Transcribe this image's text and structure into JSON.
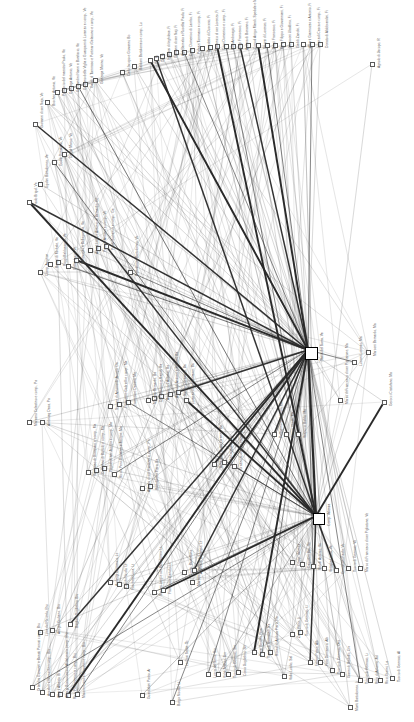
{
  "meta": {
    "background_color": "#ffffff",
    "node_fill": "#ffffff",
    "node_stroke": "#5a5a5a",
    "edge_color": "#2a2a2a",
    "label_color": "#3c3c3c",
    "label_rotation_deg": -90,
    "canvas": {
      "width": 414,
      "height": 722
    }
  },
  "hubs": [
    {
      "id": "hub_venezia",
      "label": "Tassa del Sorra, Ve",
      "x": 305,
      "y": 347,
      "size": 13
    },
    {
      "id": "hub_firenze",
      "label": "Comp. Valenza",
      "x": 313,
      "y": 513,
      "size": 12
    }
  ],
  "nodes": [
    {
      "label": "Giovanni di ser Naja, Ve",
      "x": 33,
      "y": 122,
      "size": 5
    },
    {
      "label": "Brocheri Antonio, Ve",
      "x": 45,
      "y": 100,
      "size": 5
    },
    {
      "label": "Peduccio del maestro Paolo, Ve",
      "x": 55,
      "y": 90,
      "size": 5
    },
    {
      "label": "Gonzaga Antonio, Ve",
      "x": 62,
      "y": 88,
      "size": 5
    },
    {
      "label": "Goccandini Nanni e Bonifacio, Ve",
      "x": 69,
      "y": 86,
      "size": 5
    },
    {
      "label": "Gaetano delle Viglia e Guasparri di Lorenzo e comp., Ve",
      "x": 76,
      "y": 84,
      "size": 5
    },
    {
      "label": "Gaudi di Tommaso e Portinari Gelasono e comp., Ve",
      "x": 83,
      "y": 82,
      "size": 5
    },
    {
      "label": "Gonzaga Marino, Ve",
      "x": 93,
      "y": 78,
      "size": 5
    },
    {
      "label": "Carlo Iacopo e Giovanni, Bo",
      "x": 120,
      "y": 70,
      "size": 5
    },
    {
      "label": "Baldiani Bartolomeo e comp., Lu",
      "x": 132,
      "y": 64,
      "size": 5
    },
    {
      "label": "Dir, Fi",
      "x": 148,
      "y": 58,
      "size": 5
    },
    {
      "label": "Dir, Fi",
      "x": 154,
      "y": 56,
      "size": 5
    },
    {
      "label": "Inghilesi di Inghilese, Fi",
      "x": 160,
      "y": 54,
      "size": 5
    },
    {
      "label": "Giovanni di ser Naji, Fi",
      "x": 167,
      "y": 52,
      "size": 5
    },
    {
      "label": "Agli Barnabo e Rucellai Paolo, Fi",
      "x": 174,
      "y": 50,
      "size": 5
    },
    {
      "label": "Di ser Domenico di Lambo, Fi",
      "x": 182,
      "y": 50,
      "size": 5
    },
    {
      "label": "Palazzi Tommaso e comp., Fi",
      "x": 190,
      "y": 48,
      "size": 5
    },
    {
      "label": "Benedetto di Duccerio, Fi",
      "x": 200,
      "y": 46,
      "size": 5
    },
    {
      "label": "Domenico di ser Lorenzo, Fi",
      "x": 208,
      "y": 45,
      "size": 5
    },
    {
      "label": "Corsi Domenico e comp., Fi",
      "x": 215,
      "y": 44,
      "size": 5
    },
    {
      "label": "Boni Andreagio, Fi",
      "x": 224,
      "y": 44,
      "size": 5
    },
    {
      "label": "Longi Francesco, Fi",
      "x": 231,
      "y": 44,
      "size": 5
    },
    {
      "label": "Andrea di Bonanno, Fi",
      "x": 238,
      "y": 44,
      "size": 5
    },
    {
      "label": "Corsoli Arrigo Mandi, Spedale e Miliorotti, Fi",
      "x": 246,
      "y": 43,
      "size": 5
    },
    {
      "label": "Strozzi di Lorenzo, Fi",
      "x": 256,
      "y": 43,
      "size": 5
    },
    {
      "label": "Bosci Francesco, Fi",
      "x": 265,
      "y": 43,
      "size": 5
    },
    {
      "label": "Ricci Filippo e Giovanniani, Fi",
      "x": 273,
      "y": 43,
      "size": 5
    },
    {
      "label": "Guasconi Ubaldino, Fi",
      "x": 281,
      "y": 42,
      "size": 5
    },
    {
      "label": "Gaddi Zanobi, Fi",
      "x": 289,
      "y": 42,
      "size": 5
    },
    {
      "label": "Alberti Giannozzo e Antonio, Fi",
      "x": 301,
      "y": 42,
      "size": 5
    },
    {
      "label": "Lorenzoli Cesca e comp., Fi",
      "x": 310,
      "y": 42,
      "size": 5
    },
    {
      "label": "Donato di Aldobrandini, Fi",
      "x": 318,
      "y": 42,
      "size": 5
    },
    {
      "label": "Agnolo di Jacopo, R",
      "x": 370,
      "y": 62,
      "size": 5
    },
    {
      "label": "Paolo Brigol, Ve",
      "x": 27,
      "y": 200,
      "size": 5
    },
    {
      "label": "Ugolini Bartolomeo, Ve",
      "x": 38,
      "y": 182,
      "size": 5
    },
    {
      "label": "Goddi Donatello, Ve",
      "x": 52,
      "y": 160,
      "size": 5
    },
    {
      "label": "Diegol Marco, Ve",
      "x": 62,
      "y": 152,
      "size": 5
    },
    {
      "label": "Comp. Avignon",
      "x": 38,
      "y": 270,
      "size": 5
    },
    {
      "label": "Bonso di Michele, Ve",
      "x": 48,
      "y": 262,
      "size": 5
    },
    {
      "label": "Poggi Baldassarre, Ve",
      "x": 56,
      "y": 260,
      "size": 5
    },
    {
      "label": "Cellini Lucia, Ve",
      "x": 66,
      "y": 264,
      "size": 5
    },
    {
      "label": "Bentivoglio e Bellagamba, Ve",
      "x": 74,
      "y": 258,
      "size": 5
    },
    {
      "label": "Alberti Lapo e Antonio di Bernardo, Ge",
      "x": 88,
      "y": 248,
      "size": 5
    },
    {
      "label": "Peruzzi Antonio e comp., Ve",
      "x": 96,
      "y": 246,
      "size": 5
    },
    {
      "label": "Paolo Sorranco e comp., Ge",
      "x": 104,
      "y": 244,
      "size": 5
    },
    {
      "label": "Bartolomeo Bartolomeo, Ve",
      "x": 128,
      "y": 270,
      "size": 5
    },
    {
      "label": "Marzano Celestino e comp., Pa",
      "x": 27,
      "y": 420,
      "size": 5
    },
    {
      "label": "Ambroeg Desa, Pa",
      "x": 40,
      "y": 420,
      "size": 5
    },
    {
      "label": "Simone di Antonio di Jacopo, Da",
      "x": 108,
      "y": 404,
      "size": 5
    },
    {
      "label": "Francesco Gabrielli e comp., Ma",
      "x": 117,
      "y": 402,
      "size": 5
    },
    {
      "label": "Francesco Desanti, Ma",
      "x": 126,
      "y": 400,
      "size": 5
    },
    {
      "label": "Marsetti Bernardo, Ba",
      "x": 146,
      "y": 398,
      "size": 5
    },
    {
      "label": "Di Francesco e Napoli, Ba",
      "x": 152,
      "y": 396,
      "size": 5
    },
    {
      "label": "Arriguccio d'Antonio, Ba",
      "x": 159,
      "y": 394,
      "size": 5
    },
    {
      "label": "Acciaiuoli Antonio e Soldani, Ba",
      "x": 168,
      "y": 392,
      "size": 5
    },
    {
      "label": "Sacchi Cristofano, Ba",
      "x": 176,
      "y": 390,
      "size": 5
    },
    {
      "label": "Lorenzo di ser Giovanni, Ba",
      "x": 184,
      "y": 398,
      "size": 5
    },
    {
      "label": "Tommaso di Guasparri e comp., Ma",
      "x": 86,
      "y": 470,
      "size": 5
    },
    {
      "label": "Di Ruffino di Bartolo e comp., Ma",
      "x": 94,
      "y": 468,
      "size": 5
    },
    {
      "label": "Pagolo di ser Jacopo e comp., Ma",
      "x": 102,
      "y": 466,
      "size": 5
    },
    {
      "label": "Riccio Pero Giovanni e Jacopo, Ma",
      "x": 112,
      "y": 472,
      "size": 5
    },
    {
      "label": "Antonio di ser Giovanni e comp., Pa",
      "x": 140,
      "y": 486,
      "size": 5
    },
    {
      "label": "Bartolomeo Piero, Ba",
      "x": 148,
      "y": 484,
      "size": 5
    },
    {
      "label": "Benedetto di ser Lorenzo, Ba",
      "x": 212,
      "y": 462,
      "size": 5
    },
    {
      "label": "Sabba Leopoldo, Ba",
      "x": 222,
      "y": 460,
      "size": 5
    },
    {
      "label": "Grazzi Nicoloso e comp., Ba",
      "x": 232,
      "y": 464,
      "size": 5
    },
    {
      "label": "Pellegrino Galdoroni, Ma",
      "x": 272,
      "y": 432,
      "size": 5
    },
    {
      "label": "Conge Ubaldi, Ma",
      "x": 284,
      "y": 432,
      "size": 5
    },
    {
      "label": "Vespucci Baldo, Ma",
      "x": 296,
      "y": 432,
      "size": 5
    },
    {
      "label": "Marzo di Francesco di ser Pigrizzone, Ma",
      "x": 338,
      "y": 398,
      "size": 5
    },
    {
      "label": "Luciani Lorenzo, Ma",
      "x": 352,
      "y": 360,
      "size": 5
    },
    {
      "label": "Marconi Bernardo, Ma",
      "x": 366,
      "y": 350,
      "size": 5
    },
    {
      "label": "Gerocci Cristofano, Ma",
      "x": 382,
      "y": 400,
      "size": 5
    },
    {
      "label": "Comp. Valenza",
      "x": 290,
      "y": 560,
      "size": 5
    },
    {
      "label": "Dagostini Bini, Ve",
      "x": 300,
      "y": 562,
      "size": 5
    },
    {
      "label": "Ridolfi Antonio, Ve",
      "x": 311,
      "y": 564,
      "size": 5
    },
    {
      "label": "Vettiglia Laura, Ve",
      "x": 322,
      "y": 566,
      "size": 5
    },
    {
      "label": "Giustiniani Paolo, Ve",
      "x": 334,
      "y": 568,
      "size": 5
    },
    {
      "label": "Tuccio di Gennaio, Ve",
      "x": 346,
      "y": 566,
      "size": 5
    },
    {
      "label": "Marco di Francesco di ser Pigliatone, Ve",
      "x": 358,
      "y": 566,
      "size": 5
    },
    {
      "label": "Orlandini Giovanni e Benati Pierozi comp., Bru",
      "x": 30,
      "y": 685,
      "size": 5
    },
    {
      "label": "Anselmi e Bernardini comp., Bru",
      "x": 40,
      "y": 690,
      "size": 5
    },
    {
      "label": "Alberti Alberto, Bru",
      "x": 50,
      "y": 692,
      "size": 5
    },
    {
      "label": "Albergi Bonaccorso e Alidalonisio comp., Bru",
      "x": 58,
      "y": 692,
      "size": 5
    },
    {
      "label": "Ricci Pedomenico e comp., Bru",
      "x": 66,
      "y": 693,
      "size": 5
    },
    {
      "label": "Maiorini Lapo e Giovanni e comp., Bru",
      "x": 75,
      "y": 692,
      "size": 5
    },
    {
      "label": "Luca del Ricordo, Bru",
      "x": 38,
      "y": 630,
      "size": 5
    },
    {
      "label": "Ansgiu Giuliano, Bru",
      "x": 50,
      "y": 628,
      "size": 5
    },
    {
      "label": "Baglioni Guglielmo, Bru",
      "x": 68,
      "y": 622,
      "size": 5
    },
    {
      "label": "Guardabini Pietro, Ar",
      "x": 140,
      "y": 693,
      "size": 5
    },
    {
      "label": "Borgo Nicolai, Lt",
      "x": 170,
      "y": 700,
      "size": 5
    },
    {
      "label": "La Grai Setas, To",
      "x": 178,
      "y": 660,
      "size": 5
    },
    {
      "label": "Ambrogi Domenico, Lt",
      "x": 108,
      "y": 580,
      "size": 5
    },
    {
      "label": "Lucchi Nicolo, Lt",
      "x": 117,
      "y": 582,
      "size": 5
    },
    {
      "label": "Facchetti Luca, Lt",
      "x": 124,
      "y": 584,
      "size": 5
    },
    {
      "label": "Scalieri Luigi e ser Bartolomeo, Lt",
      "x": 152,
      "y": 590,
      "size": 5
    },
    {
      "label": "Francesco Bartolo, Lt",
      "x": 161,
      "y": 588,
      "size": 5
    },
    {
      "label": "Marsetti Francesco, Lt",
      "x": 190,
      "y": 580,
      "size": 5
    },
    {
      "label": "Comp. Barcellona",
      "x": 182,
      "y": 570,
      "size": 5
    },
    {
      "label": "Andrea di Bonanno, Lt",
      "x": 192,
      "y": 568,
      "size": 5
    },
    {
      "label": "Lucca del Serra, Sm",
      "x": 206,
      "y": 672,
      "size": 5
    },
    {
      "label": "Vidali Matteo, Sm",
      "x": 216,
      "y": 672,
      "size": 5
    },
    {
      "label": "Tuccio di Gennaio, Sm",
      "x": 226,
      "y": 672,
      "size": 5
    },
    {
      "label": "Corso Guglielmo, Sm",
      "x": 236,
      "y": 670,
      "size": 5
    },
    {
      "label": "Prinzi Bernini, Pisa",
      "x": 252,
      "y": 650,
      "size": 5
    },
    {
      "label": "Tuccio di Tommaso, Na",
      "x": 260,
      "y": 652,
      "size": 5
    },
    {
      "label": "Rosaci di Andrea Piero, Na",
      "x": 268,
      "y": 650,
      "size": 5
    },
    {
      "label": "Valla Lucilio, Sal",
      "x": 282,
      "y": 674,
      "size": 5
    },
    {
      "label": "Zenai Piero, Li",
      "x": 290,
      "y": 632,
      "size": 5
    },
    {
      "label": "Tuccio di Gennaio, Li",
      "x": 298,
      "y": 630,
      "size": 5
    },
    {
      "label": "Ferrari Pietro, Alb",
      "x": 308,
      "y": 660,
      "size": 5
    },
    {
      "label": "Ferri Domenico, Alb",
      "x": 318,
      "y": 660,
      "size": 5
    },
    {
      "label": "Tuccio di Gennaio, Ont",
      "x": 330,
      "y": 668,
      "size": 5
    },
    {
      "label": "Gianni di Rodolfo, Civ",
      "x": 340,
      "y": 672,
      "size": 5
    },
    {
      "label": "Monti Bartolomeo, Li",
      "x": 348,
      "y": 705,
      "size": 5
    },
    {
      "label": "Tuccio di Gennaio, Li",
      "x": 358,
      "y": 678,
      "size": 5
    },
    {
      "label": "Ricci di Antonio, Jal",
      "x": 368,
      "y": 678,
      "size": 5
    },
    {
      "label": "Ricci Gianni, La",
      "x": 378,
      "y": 678,
      "size": 5
    },
    {
      "label": "Tuccio di Gennaio, Al",
      "x": 390,
      "y": 676,
      "size": 5
    }
  ]
}
